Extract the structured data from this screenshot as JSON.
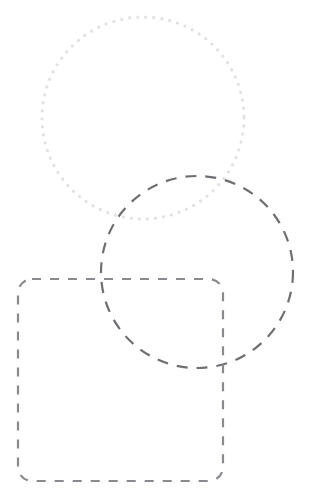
{
  "canvas": {
    "width": 316,
    "height": 500,
    "background_color": "#ffffff",
    "title": "Overlapping geometric outlines"
  },
  "shapes": [
    {
      "id": "dotted-circle",
      "name": "dotted-circle",
      "kind": "circle",
      "stroke_style": "dotted",
      "stroke_color": "#e2e2e2",
      "stroke_width": 3.2,
      "dash_pattern": "0.1 8",
      "fill": "none",
      "cx": 143,
      "cy": 118,
      "r": 101
    },
    {
      "id": "dashed-circle",
      "name": "dashed-circle",
      "kind": "circle",
      "stroke_style": "dashed",
      "stroke_color": "#6f6f73",
      "stroke_width": 2.2,
      "dash_pattern": "11 9",
      "fill": "none",
      "cx": 197,
      "cy": 272,
      "r": 96
    },
    {
      "id": "dashed-rounded-rect",
      "name": "dashed-rounded-rectangle",
      "kind": "rounded-rect",
      "stroke_style": "dashed",
      "stroke_color": "#8a8a8e",
      "stroke_width": 2.2,
      "dash_pattern": "9 9",
      "fill": "none",
      "x": 18,
      "y": 279,
      "width": 205,
      "height": 202,
      "rx": 14
    }
  ],
  "chart_data": {
    "type": "scatter",
    "xlabel": "",
    "ylabel": "",
    "xlim": [
      0,
      316
    ],
    "ylim": [
      0,
      500
    ],
    "grid": false,
    "legend": "none",
    "annotations": [
      "dotted circle centered at (143, 118) radius 101",
      "dashed circle centered at (197, 272) radius 96",
      "dashed rounded rectangle from (18, 279) size 205 x 202 corner radius 14"
    ]
  }
}
